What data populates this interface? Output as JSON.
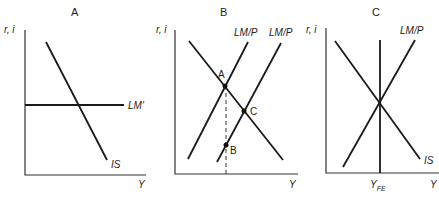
{
  "panels": [
    {
      "title": "A",
      "y_axis_label": "r, i",
      "x_axis_label": "Y",
      "curves": {
        "is": "IS",
        "lm": "LM'"
      }
    },
    {
      "title": "B",
      "y_axis_label": "r, i",
      "x_axis_label": "Y",
      "curves": {
        "lm1": "LM/P",
        "lm2": "LM/P"
      },
      "points": {
        "a": "A",
        "b": "B",
        "c": "C"
      }
    },
    {
      "title": "C",
      "y_axis_label": "r, i",
      "x_axis_label": "Y",
      "x_marker": "Y",
      "x_marker_sub": "FE",
      "curves": {
        "lm": "LM/P",
        "is": "IS"
      }
    }
  ]
}
